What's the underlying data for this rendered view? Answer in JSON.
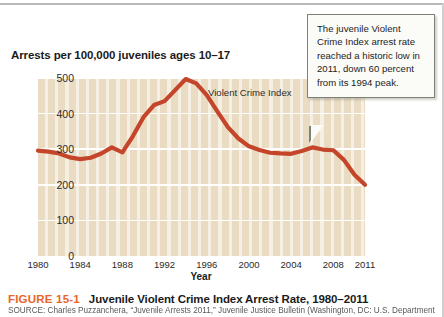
{
  "figure": {
    "number_label": "FIGURE 15-1",
    "title": "Juvenile Violent Crime Index Arrest Rate, 1980–2011",
    "number_color": "#e8662a",
    "source": "SOURCE: Charles Puzzanchera, “Juvenile Arrests 2011,” Juvenile Justice Bulletin (Washington, DC: U.S. Department"
  },
  "callout": {
    "text": "The juvenile Violent Crime Index arrest rate reached a historic low in 2011, down 60 percent from its 1994 peak.",
    "border_color": "#7e8274",
    "background_color": "#fbfbf8"
  },
  "chart_data": {
    "type": "line",
    "title": "Arrests per 100,000 juveniles ages 10–17",
    "xlabel": "Year",
    "ylabel": "",
    "series_annotation": "Violent Crime Index",
    "line_color": "#c4452a",
    "plot_background": "#e9dcc3",
    "gridline_color": "#ffffff",
    "grid": true,
    "legend_position": "inline-annotation",
    "xlim": [
      1980,
      2011
    ],
    "ylim": [
      0,
      500
    ],
    "yticks": [
      0,
      100,
      200,
      300,
      400,
      500
    ],
    "ytick_labels": [
      "0",
      "100",
      "200",
      "300",
      "400",
      "500"
    ],
    "xticks": [
      1980,
      1984,
      1988,
      1992,
      1996,
      2000,
      2004,
      2008,
      2011
    ],
    "xtick_labels": [
      "1980",
      "1984",
      "1988",
      "1992",
      "1996",
      "2000",
      "2004",
      "2008",
      "2011"
    ],
    "x": [
      1980,
      1981,
      1982,
      1983,
      1984,
      1985,
      1986,
      1987,
      1988,
      1989,
      1990,
      1991,
      1992,
      1993,
      1994,
      1995,
      1996,
      1997,
      1998,
      1999,
      2000,
      2001,
      2002,
      2003,
      2004,
      2005,
      2006,
      2007,
      2008,
      2009,
      2010,
      2011
    ],
    "values": [
      296,
      293,
      288,
      277,
      272,
      276,
      288,
      305,
      291,
      337,
      390,
      424,
      435,
      466,
      497,
      485,
      452,
      406,
      362,
      330,
      308,
      298,
      290,
      288,
      287,
      295,
      305,
      299,
      297,
      270,
      228,
      200
    ]
  }
}
